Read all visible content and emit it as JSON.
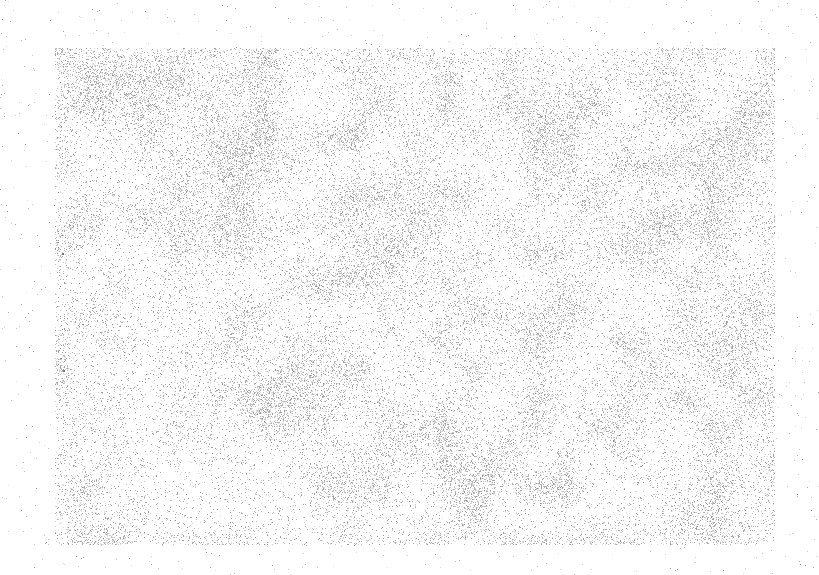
{
  "image": {
    "description": "speckled grey noise texture on white background",
    "width": 819,
    "height": 575,
    "background_color": "#ffffff",
    "texture_region": {
      "x": 55,
      "y": 48,
      "width": 720,
      "height": 497
    },
    "speckle_color": "#9a9a9a",
    "stray_dots": [
      {
        "x": 62,
        "y": 253
      },
      {
        "x": 63,
        "y": 370
      }
    ]
  }
}
